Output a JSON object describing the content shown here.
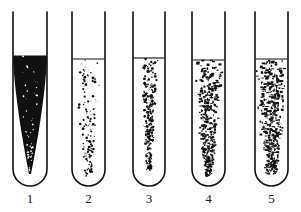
{
  "figure": {
    "background_color": "#ffffff",
    "ink_color": "#111111",
    "tube_count": 5,
    "width": 301,
    "height": 212
  },
  "tubes": [
    {
      "id": "tube-1",
      "label": "1",
      "left_wall_x": 13,
      "right_wall_x": 47,
      "top_y": 12,
      "bottom_y": 186,
      "fill_line_y": 56,
      "pattern": "solid-dense-wedge",
      "pattern_description": "Solid confluent dark wedge, broad at the surface, tapering to a fine needle point near the bottom",
      "density": 1.0,
      "column_top_width": 34,
      "column_bottom_width": 2,
      "column_bottom_y": 174,
      "speckle_count": 0,
      "seed": 11
    },
    {
      "id": "tube-2",
      "label": "2",
      "left_wall_x": 72,
      "right_wall_x": 105,
      "top_y": 12,
      "bottom_y": 186,
      "fill_line_y": 59,
      "pattern": "sparse-speckled-taper",
      "pattern_description": "Loose scattered fine specks, densest just below the surface, thinning into a narrow diffuse trail toward the bottom",
      "density": 0.3,
      "column_top_width": 26,
      "column_bottom_width": 8,
      "column_bottom_y": 176,
      "speckle_count": 360,
      "seed": 22
    },
    {
      "id": "tube-3",
      "label": "3",
      "left_wall_x": 133,
      "right_wall_x": 165,
      "top_y": 12,
      "bottom_y": 186,
      "fill_line_y": 58,
      "pattern": "narrow-dense-taper",
      "pattern_description": "Narrow, heavily clotted central column of coarse flecks tapering to a point above the rounded base",
      "density": 0.72,
      "column_top_width": 18,
      "column_bottom_width": 5,
      "column_bottom_y": 170,
      "speckle_count": 420,
      "seed": 33
    },
    {
      "id": "tube-4",
      "label": "4",
      "left_wall_x": 192,
      "right_wall_x": 225,
      "top_y": 12,
      "bottom_y": 186,
      "fill_line_y": 60,
      "pattern": "wide-blocky-taper",
      "pattern_description": "Broad block-like aggregates spanning nearly the full tube width at the surface, narrowing into a ragged tail near the base",
      "density": 0.8,
      "column_top_width": 32,
      "column_bottom_width": 7,
      "column_bottom_y": 176,
      "speckle_count": 520,
      "seed": 44
    },
    {
      "id": "tube-5",
      "label": "5",
      "left_wall_x": 255,
      "right_wall_x": 288,
      "top_y": 12,
      "bottom_y": 186,
      "fill_line_y": 59,
      "pattern": "full-width-dense",
      "pattern_description": "Dense coarse growth filling the full tube width from the surface downward, tapering only slightly into the rounded base",
      "density": 0.88,
      "column_top_width": 33,
      "column_bottom_width": 12,
      "column_bottom_y": 174,
      "speckle_count": 620,
      "seed": 55
    }
  ]
}
